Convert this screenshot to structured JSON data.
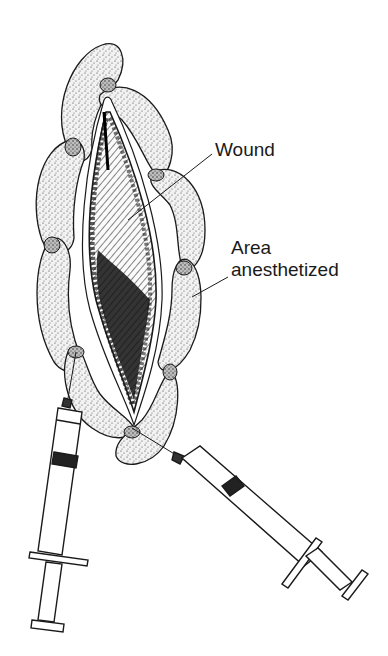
{
  "figure": {
    "colors": {
      "ink": "#1a1a1a",
      "background": "#ffffff",
      "stipple_fill": "#e9e9e9",
      "wound_dark": "#111111"
    }
  },
  "labels": {
    "wound": "Wound",
    "area_line1": "Area",
    "area_line2": "anesthetized"
  },
  "elements": {
    "wound": "diamond-shaped hatched wound",
    "anesthetized_lobes": 6,
    "syringes": [
      "left-syringe",
      "right-syringe"
    ]
  }
}
